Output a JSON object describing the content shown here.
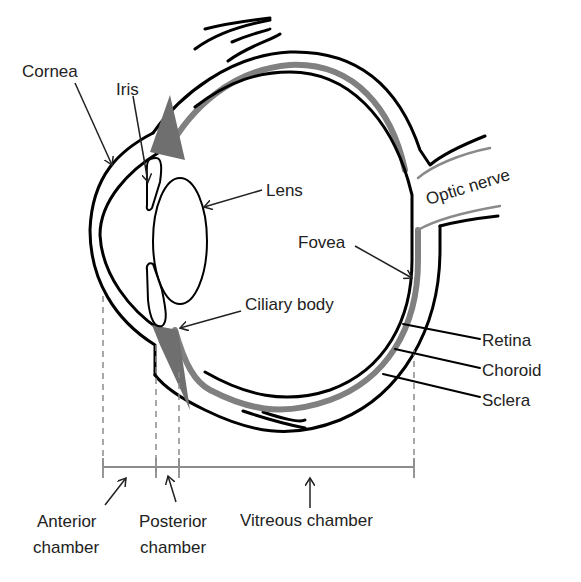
{
  "diagram": {
    "labels": {
      "cornea": "Cornea",
      "iris": "Iris",
      "lens": "Lens",
      "optic_nerve": "Optic nerve",
      "fovea": "Fovea",
      "ciliary_body": "Ciliary body",
      "retina": "Retina",
      "choroid": "Choroid",
      "sclera": "Sclera"
    },
    "chambers": {
      "anterior_line1": "Anterior",
      "anterior_line2": "chamber",
      "posterior_line1": "Posterior",
      "posterior_line2": "chamber",
      "vitreous": "Vitreous chamber"
    },
    "colors": {
      "outline": "#000000",
      "choroid_grey": "#808080",
      "guide_lines": "#8c8c8c",
      "text": "#222222",
      "background": "#ffffff"
    }
  }
}
